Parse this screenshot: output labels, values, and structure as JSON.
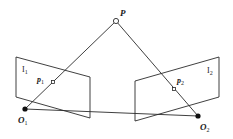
{
  "diagram": {
    "colors": {
      "line": "#2a2a2a",
      "background": "#ffffff",
      "point_fill": "#111111",
      "hollow_fill": "#ffffff"
    },
    "labels": {
      "P": {
        "main": "P",
        "sub": ""
      },
      "p1": {
        "main": "p",
        "sub": "1"
      },
      "p2": {
        "main": "p",
        "sub": "2"
      },
      "O1": {
        "main": "O",
        "sub": "1"
      },
      "O2": {
        "main": "O",
        "sub": "2"
      },
      "I1": {
        "main": "I",
        "sub": "1"
      },
      "I2": {
        "main": "I",
        "sub": "2"
      }
    },
    "points": {
      "P": [
        116,
        21
      ],
      "p1": [
        53,
        82
      ],
      "p2": [
        174,
        89
      ],
      "O1": [
        25,
        109
      ],
      "O2": [
        198,
        116
      ]
    },
    "planes": {
      "image_plane_1": [
        [
          16,
          57
        ],
        [
          90,
          77
        ],
        [
          90,
          118
        ],
        [
          16,
          97
        ]
      ],
      "image_plane_2": [
        [
          135,
          81
        ],
        [
          219,
          57
        ],
        [
          219,
          97
        ],
        [
          135,
          121
        ]
      ]
    },
    "edges": [
      [
        "O1",
        "P"
      ],
      [
        "O2",
        "P"
      ],
      [
        "O1",
        "O2"
      ]
    ]
  }
}
